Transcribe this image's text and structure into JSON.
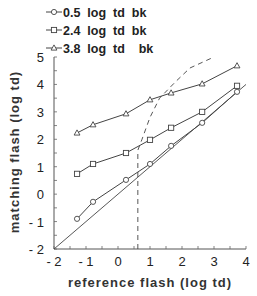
{
  "chart_data": {
    "type": "line",
    "title": "",
    "xlabel": "reference  flash  (log  td)",
    "ylabel": "matching flash (log td)",
    "xlim": [
      -2,
      4
    ],
    "ylim": [
      -2,
      5
    ],
    "xticks": [
      -2,
      -1,
      0,
      1,
      2,
      3,
      4
    ],
    "yticks": [
      -2,
      -1,
      0,
      1,
      2,
      3,
      4,
      5
    ],
    "xtick_labels": [
      "- 2",
      "- 1",
      "0",
      "1",
      "2",
      "3",
      "4"
    ],
    "ytick_labels": [
      "- 2",
      "- 1",
      "0",
      "1",
      "2",
      "3",
      "4",
      "5"
    ],
    "grid": false,
    "legend_position": "top-left",
    "series": [
      {
        "name": "0.5  log  td  bk",
        "marker": "circle",
        "x": [
          -1.28,
          -0.78,
          0.25,
          1.0,
          1.66,
          2.63,
          3.72
        ],
        "y": [
          -0.9,
          -0.28,
          0.52,
          1.1,
          1.76,
          2.6,
          3.73
        ]
      },
      {
        "name": "2.4  log  td  bk",
        "marker": "square",
        "x": [
          -1.28,
          -0.78,
          0.25,
          1.0,
          1.66,
          2.63,
          3.72
        ],
        "y": [
          0.74,
          1.1,
          1.5,
          1.98,
          2.42,
          3.0,
          3.95
        ]
      },
      {
        "name": "3.8  log  td    bk",
        "marker": "triangle",
        "x": [
          -1.28,
          -0.78,
          0.25,
          1.0,
          1.66,
          2.63,
          3.72
        ],
        "y": [
          2.23,
          2.53,
          2.93,
          3.44,
          3.69,
          4.02,
          4.68
        ]
      }
    ],
    "reference_lines": [
      {
        "name": "identity",
        "style": "solid",
        "x": [
          -2,
          4
        ],
        "y": [
          -2,
          4
        ]
      },
      {
        "name": "dashed-curve",
        "style": "dashed",
        "x": [
          0.62,
          0.62,
          0.75,
          1.0,
          1.3,
          1.8,
          2.25,
          3.0
        ],
        "y": [
          -2,
          1.6,
          2.0,
          2.8,
          3.5,
          4.1,
          4.6,
          5.0
        ]
      }
    ]
  },
  "legend": [
    {
      "marker": "circle",
      "label": "0.5  log  td  bk"
    },
    {
      "marker": "square",
      "label": "2.4  log  td  bk"
    },
    {
      "marker": "triangle",
      "label": "3.8  log  td    bk"
    }
  ],
  "axes": {
    "xlabel": "reference  flash  (log  td)",
    "ylabel": "matching flash (log td)"
  },
  "colors": {
    "line": "#444444",
    "text": "#222222"
  }
}
